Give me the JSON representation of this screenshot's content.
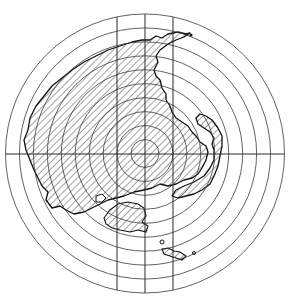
{
  "map": {
    "title": "",
    "description": "Concentric range rings over a hatched coastline map",
    "ring_count": 10,
    "grid": {
      "vertical_lines": 3,
      "horizontal_lines": 1
    },
    "colors": {
      "line": "#3a3a3a",
      "coast": "#111111",
      "background": "#ffffff"
    },
    "features": [
      {
        "name": "mainland",
        "style": "hatched"
      },
      {
        "name": "northern-peninsula",
        "style": "hatched"
      },
      {
        "name": "hook-cape",
        "style": "hatched"
      },
      {
        "name": "large-island",
        "style": "hatched"
      },
      {
        "name": "small-island-southeast",
        "style": "hatched"
      },
      {
        "name": "offshore-point",
        "style": "dot"
      }
    ]
  }
}
